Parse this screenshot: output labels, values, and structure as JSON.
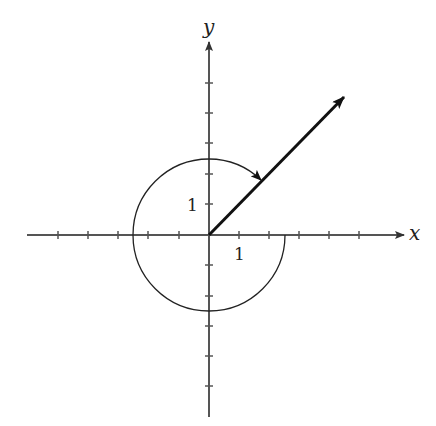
{
  "diagram": {
    "type": "angle-in-standard-position",
    "axes": {
      "x_label": "x",
      "y_label": "y",
      "x_range": [
        -6,
        6.5
      ],
      "y_range": [
        -6,
        6.4
      ],
      "tick_spacing": 1
    },
    "unit_labels": {
      "x_unit": "1",
      "y_unit": "1"
    },
    "terminal_ray": {
      "angle_degrees": 45,
      "description": "terminal side in quadrant I"
    },
    "rotation_arc": {
      "direction": "clockwise",
      "start": "positive x-axis",
      "sweep_degrees": -315,
      "radius_units": 2.5
    },
    "colors": {
      "line": "#222222",
      "background": "#ffffff"
    }
  }
}
